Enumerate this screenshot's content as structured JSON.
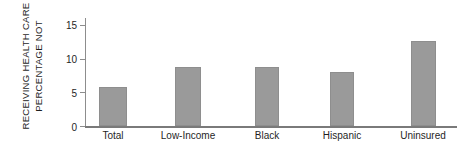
{
  "chart_data": {
    "type": "bar",
    "title": "",
    "xlabel": "",
    "ylabel": "PERCENTAGE NOT RECEIVING HEALTH CARE",
    "ylabel_lines": [
      "PERCENTAGE NOT",
      "RECEIVING HEALTH CARE"
    ],
    "categories": [
      "Total",
      "Low-Income",
      "Black",
      "Hispanic",
      "Uninsured"
    ],
    "values": [
      5.8,
      8.7,
      8.8,
      8.0,
      12.6
    ],
    "ylim": [
      0,
      16
    ],
    "yticks": [
      0,
      5,
      10,
      15
    ],
    "ytick_labels": [
      "0",
      "5",
      "10",
      "15"
    ],
    "grid": false,
    "legend": null,
    "bar_color": "#9a9a9a",
    "axis_color": "#8d8d8d"
  }
}
